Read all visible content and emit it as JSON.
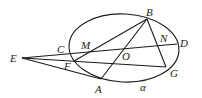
{
  "diagram": {
    "type": "geometry",
    "points": {
      "E": "E",
      "C": "C",
      "M": "M",
      "F": "F",
      "O": "O",
      "A": "A",
      "B": "B",
      "N": "N",
      "D": "D",
      "G": "G"
    },
    "plane_label": "α",
    "segments": [
      [
        "E",
        "D"
      ],
      [
        "E",
        "G"
      ],
      [
        "E",
        "A"
      ],
      [
        "F",
        "B"
      ],
      [
        "A",
        "B"
      ],
      [
        "B",
        "G"
      ]
    ]
  }
}
